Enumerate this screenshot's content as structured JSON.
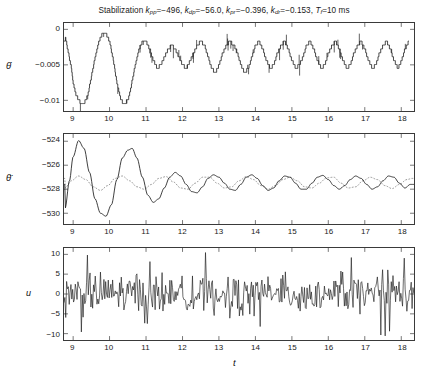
{
  "figure": {
    "title_prefix": "Stabilization",
    "title_params": [
      {
        "sym": "k",
        "sub": "pp",
        "val": "=−496,"
      },
      {
        "sym": "k",
        "sub": "dp",
        "val": "=−56.0,"
      },
      {
        "sym": "k",
        "sub": "pr",
        "val": "=−0.396,"
      },
      {
        "sym": "k",
        "sub": "dr",
        "val": "=−0.153,"
      },
      {
        "sym": "T",
        "sub": "f",
        "val": "=10 ms"
      }
    ],
    "title_plain": "Stabilization kpp=−496, kdp=−56.0, kpr=−0.396, kdr=−0.153, Tf=10 ms",
    "xlabel": "t",
    "line_color": "#1a1a1a",
    "axis_color": "#3a3a3a",
    "dotted_color": "#8c8c8c"
  },
  "chart_data": [
    {
      "type": "line",
      "name": "theta-dot-panel",
      "ylabel": "θ̇",
      "ylabel_glyph": "theta-dot",
      "xlabel": "",
      "xlim": [
        8.75,
        18.35
      ],
      "ylim": [
        -0.0115,
        0.0009
      ],
      "yticks": [
        0,
        -0.005,
        -0.01
      ],
      "ytick_labels": [
        "0",
        "−0.005",
        "−0.01"
      ],
      "xticks": [
        9,
        10,
        11,
        12,
        13,
        14,
        15,
        16,
        17,
        18
      ],
      "grid": false,
      "style": "staircase-quantized-with-spikes",
      "quantum": 0.00055,
      "series": [
        {
          "name": "theta-dot",
          "style": "solid",
          "description": "quantized staircase, initial large dip to -0.0105 near t=9.2 and t=10.3, then periodic sawtooth band between -0.0012 and -0.0075 with downward spikes",
          "x": [
            8.78,
            8.85,
            8.95,
            9.02,
            9.08,
            9.14,
            9.2,
            9.3,
            9.4,
            9.5,
            9.6,
            9.7,
            9.8,
            9.9,
            10.0,
            10.1,
            10.2,
            10.3,
            10.4,
            10.5,
            10.6,
            10.7,
            10.8,
            10.9,
            11.0,
            11.1,
            11.2,
            11.3,
            11.4,
            11.5,
            11.6,
            11.7,
            11.8,
            11.9,
            12.0,
            12.1,
            12.2,
            12.3,
            12.4,
            12.5,
            12.6,
            12.7,
            12.8,
            12.9,
            13.0,
            13.1,
            13.2,
            13.3,
            13.4,
            13.5,
            13.6,
            13.7,
            13.8,
            13.9,
            14.0,
            14.1,
            14.2,
            14.3,
            14.4,
            14.5,
            14.6,
            14.7,
            14.8,
            14.9,
            15.0,
            15.1,
            15.2,
            15.3,
            15.4,
            15.5,
            15.6,
            15.7,
            15.8,
            15.9,
            16.0,
            16.1,
            16.2,
            16.3,
            16.4,
            16.5,
            16.6,
            16.7,
            16.8,
            16.9,
            17.0,
            17.1,
            17.2,
            17.3,
            17.4,
            17.5,
            17.6,
            17.7,
            17.8,
            17.9,
            18.0,
            18.1,
            18.2,
            18.3
          ],
          "y": [
            -0.0011,
            -0.0028,
            -0.0055,
            -0.0082,
            -0.0093,
            -0.0098,
            -0.0104,
            -0.0104,
            -0.0093,
            -0.0066,
            -0.0039,
            -0.0017,
            -0.0006,
            -0.0006,
            -0.0017,
            -0.0044,
            -0.0077,
            -0.0099,
            -0.0105,
            -0.0099,
            -0.0077,
            -0.005,
            -0.0028,
            -0.0017,
            -0.0017,
            -0.0028,
            -0.0044,
            -0.0055,
            -0.005,
            -0.0039,
            -0.0028,
            -0.0022,
            -0.0028,
            -0.0039,
            -0.005,
            -0.0055,
            -0.0044,
            -0.0033,
            -0.0022,
            -0.0017,
            -0.0022,
            -0.0039,
            -0.0055,
            -0.0061,
            -0.005,
            -0.0033,
            -0.0022,
            -0.0017,
            -0.0022,
            -0.0033,
            -0.005,
            -0.0061,
            -0.0055,
            -0.0039,
            -0.0022,
            -0.0017,
            -0.0028,
            -0.0044,
            -0.0055,
            -0.005,
            -0.0033,
            -0.0022,
            -0.0017,
            -0.0028,
            -0.0044,
            -0.0055,
            -0.005,
            -0.0039,
            -0.0022,
            -0.0017,
            -0.0028,
            -0.0044,
            -0.0055,
            -0.005,
            -0.0033,
            -0.0022,
            -0.0017,
            -0.0028,
            -0.0044,
            -0.0055,
            -0.005,
            -0.0033,
            -0.0022,
            -0.0017,
            -0.0028,
            -0.0044,
            -0.0055,
            -0.005,
            -0.0033,
            -0.0022,
            -0.0017,
            -0.0028,
            -0.0044,
            -0.0055,
            -0.0044,
            -0.0028,
            -0.0017
          ]
        }
      ]
    },
    {
      "type": "line",
      "name": "theta-ddot-panel",
      "ylabel": "θ̈",
      "ylabel_glyph": "theta-double-dot",
      "xlabel": "",
      "xlim": [
        8.75,
        18.35
      ],
      "ylim": [
        -530.9,
        -523.4
      ],
      "yticks": [
        -524,
        -526,
        -528,
        -530
      ],
      "ytick_labels": [
        "−524",
        "−526",
        "−528",
        "−530"
      ],
      "xticks": [
        9,
        10,
        11,
        12,
        13,
        14,
        15,
        16,
        17,
        18
      ],
      "grid": false,
      "series": [
        {
          "name": "theta-ddot-measured",
          "style": "solid",
          "description": "large damped oscillation: peak -523.9 at t=9.15, trough -530.2 at t=9.9, peak -524.6 at t=10.6, then settling to steady ~0.7 amplitude ripple about -527.4",
          "x": [
            8.78,
            8.9,
            9.0,
            9.15,
            9.3,
            9.45,
            9.6,
            9.75,
            9.9,
            10.05,
            10.2,
            10.35,
            10.5,
            10.62,
            10.75,
            10.9,
            11.05,
            11.2,
            11.35,
            11.5,
            11.65,
            11.8,
            11.95,
            12.1,
            12.25,
            12.4,
            12.55,
            12.7,
            12.85,
            13.0,
            13.15,
            13.3,
            13.45,
            13.6,
            13.75,
            13.9,
            14.05,
            14.2,
            14.35,
            14.5,
            14.65,
            14.8,
            14.95,
            15.1,
            15.25,
            15.4,
            15.55,
            15.7,
            15.85,
            16.0,
            16.15,
            16.3,
            16.45,
            16.6,
            16.75,
            16.9,
            17.05,
            17.2,
            17.35,
            17.5,
            17.65,
            17.8,
            17.95,
            18.1,
            18.25
          ],
          "y": [
            -529.6,
            -527.3,
            -525.3,
            -523.95,
            -524.6,
            -526.6,
            -528.8,
            -530.0,
            -530.25,
            -529.3,
            -527.2,
            -525.4,
            -524.75,
            -524.6,
            -525.4,
            -527.0,
            -528.5,
            -529.1,
            -528.8,
            -527.9,
            -527.0,
            -526.6,
            -526.9,
            -527.6,
            -528.2,
            -528.3,
            -527.8,
            -527.1,
            -526.8,
            -527.0,
            -527.5,
            -528.0,
            -528.1,
            -527.6,
            -527.0,
            -526.8,
            -527.1,
            -527.7,
            -528.1,
            -527.9,
            -527.3,
            -526.9,
            -527.0,
            -527.5,
            -528.0,
            -528.0,
            -527.5,
            -527.0,
            -526.85,
            -527.2,
            -527.7,
            -528.0,
            -527.7,
            -527.2,
            -526.9,
            -527.1,
            -527.6,
            -528.0,
            -527.8,
            -527.3,
            -526.9,
            -527.0,
            -527.5,
            -527.9,
            -527.6
          ]
        },
        {
          "name": "theta-ddot-reference",
          "style": "dotted",
          "description": "dotted reference trace, smaller amplitude ripple around -527.5, roughly in antiphase with the solid curve after t=11",
          "x": [
            8.78,
            8.95,
            9.15,
            9.35,
            9.55,
            9.75,
            9.95,
            10.15,
            10.35,
            10.55,
            10.75,
            10.95,
            11.15,
            11.35,
            11.55,
            11.75,
            11.95,
            12.15,
            12.35,
            12.55,
            12.75,
            12.95,
            13.15,
            13.35,
            13.55,
            13.75,
            13.95,
            14.15,
            14.35,
            14.55,
            14.75,
            14.95,
            15.15,
            15.35,
            15.55,
            15.75,
            15.95,
            16.15,
            16.35,
            16.55,
            16.75,
            16.95,
            17.15,
            17.35,
            17.55,
            17.75,
            17.95,
            18.15,
            18.3
          ],
          "y": [
            -527.9,
            -527.3,
            -526.9,
            -527.2,
            -527.8,
            -528.1,
            -527.7,
            -527.1,
            -526.9,
            -527.3,
            -527.8,
            -528.0,
            -527.6,
            -527.1,
            -526.95,
            -527.4,
            -527.9,
            -528.0,
            -527.5,
            -527.0,
            -527.0,
            -527.5,
            -527.9,
            -527.8,
            -527.3,
            -526.95,
            -527.2,
            -527.7,
            -528.0,
            -527.7,
            -527.2,
            -527.0,
            -527.3,
            -527.8,
            -527.9,
            -527.5,
            -527.05,
            -527.0,
            -527.5,
            -527.9,
            -527.8,
            -527.3,
            -527.0,
            -527.2,
            -527.7,
            -527.95,
            -527.6,
            -527.2,
            -527.1
          ]
        }
      ]
    },
    {
      "type": "line",
      "name": "control-input-panel",
      "ylabel": "u",
      "xlabel": "t",
      "xlim": [
        8.75,
        18.35
      ],
      "ylim": [
        -11.6,
        11.6
      ],
      "yticks": [
        10,
        5,
        0,
        -5,
        -10
      ],
      "ytick_labels": [
        "10",
        "5",
        "0",
        "−5",
        "−10"
      ],
      "xticks": [
        9,
        10,
        11,
        12,
        13,
        14,
        15,
        16,
        17,
        18
      ],
      "grid": false,
      "style": "dense-high-frequency-noise",
      "series": [
        {
          "name": "u",
          "style": "solid",
          "description": "dense chattering control signal, bursts of spikes mostly within ±6 with occasional excursions to ±10, quiet flat segments near t=11.9, 13.1, 14.6, 16.0",
          "amplitude_typical": 5,
          "amplitude_max": 10.5,
          "samples_per_unit_t": 42
        }
      ]
    }
  ]
}
